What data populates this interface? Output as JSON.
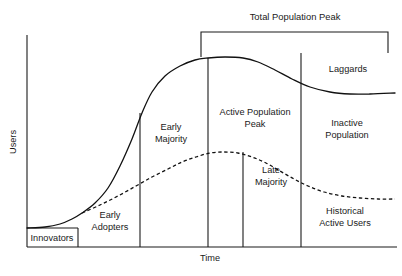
{
  "figure": {
    "type": "line",
    "background_color": "#ffffff",
    "ink_color": "#1a1a1a"
  },
  "axes": {
    "y_label": "Users",
    "x_label": "Time",
    "x_range_px": [
      27,
      395
    ],
    "y_range_px": [
      35,
      247
    ],
    "grid": false,
    "ticks": false
  },
  "bracket": {
    "label": "Total Population Peak",
    "start_px": 201,
    "end_px": 388
  },
  "segments": [
    {
      "key": "innovators",
      "label": "Innovators",
      "boundary_px": 78
    },
    {
      "key": "early-adopters",
      "label": "Early\nAdopters",
      "boundary_px": 140
    },
    {
      "key": "early-majority",
      "label": "Early\nMajority",
      "boundary_px": 208
    },
    {
      "key": "active-population-peak",
      "label": "Active Population\nPeak",
      "boundary_px": 243
    },
    {
      "key": "late-majority",
      "label": "Late\nMajority",
      "boundary_px": 301
    },
    {
      "key": "inactive-population",
      "label": "Inactive\nPopulation",
      "boundary_px": 395
    }
  ],
  "labels": {
    "innovators": "Innovators",
    "early_adopters_line1": "Early",
    "early_adopters_line2": "Adopters",
    "early_majority_line1": "Early",
    "early_majority_line2": "Majority",
    "active_peak_line1": "Active Population",
    "active_peak_line2": "Peak",
    "late_majority_line1": "Late",
    "late_majority_line2": "Majority",
    "inactive_population_line1": "Inactive",
    "inactive_population_line2": "Population",
    "laggards": "Laggards",
    "historical_line1": "Historical",
    "historical_line2": "Active Users"
  },
  "chart_data": {
    "type": "line",
    "title": "",
    "xlabel": "Time",
    "ylabel": "Users",
    "grid": false,
    "legend": "inline-annotations",
    "xlim": [
      27,
      395
    ],
    "ylim": [
      247,
      35
    ],
    "series": [
      {
        "name": "Total Population",
        "style": "solid",
        "color": "#111111",
        "points": [
          [
            27,
            228
          ],
          [
            45,
            227
          ],
          [
            60,
            224
          ],
          [
            72,
            219
          ],
          [
            82,
            213
          ],
          [
            95,
            203
          ],
          [
            108,
            188
          ],
          [
            120,
            166
          ],
          [
            132,
            139
          ],
          [
            142,
            113
          ],
          [
            152,
            92
          ],
          [
            165,
            76
          ],
          [
            180,
            66
          ],
          [
            195,
            60
          ],
          [
            208,
            58
          ],
          [
            225,
            57
          ],
          [
            243,
            58
          ],
          [
            258,
            62
          ],
          [
            275,
            70
          ],
          [
            292,
            79
          ],
          [
            310,
            87
          ],
          [
            330,
            92
          ],
          [
            350,
            94
          ],
          [
            370,
            94
          ],
          [
            395,
            93
          ]
        ]
      },
      {
        "name": "Historical Active Users",
        "style": "dashed",
        "color": "#111111",
        "points": [
          [
            82,
            213
          ],
          [
            100,
            205
          ],
          [
            118,
            196
          ],
          [
            136,
            186
          ],
          [
            152,
            177
          ],
          [
            168,
            169
          ],
          [
            182,
            162
          ],
          [
            196,
            157
          ],
          [
            210,
            153
          ],
          [
            224,
            152
          ],
          [
            238,
            153
          ],
          [
            252,
            157
          ],
          [
            266,
            163
          ],
          [
            280,
            171
          ],
          [
            294,
            179
          ],
          [
            308,
            186
          ],
          [
            324,
            192
          ],
          [
            342,
            196
          ],
          [
            360,
            198
          ],
          [
            378,
            199
          ],
          [
            395,
            199
          ]
        ]
      }
    ],
    "annotations": [
      {
        "text": "Total Population Peak",
        "x": 295,
        "y": 18,
        "role": "bracket-title"
      },
      {
        "text": "Innovators",
        "x": 52,
        "y": 239,
        "role": "segment"
      },
      {
        "text": "Early Adopters",
        "x": 110,
        "y": 222,
        "role": "segment"
      },
      {
        "text": "Early Majority",
        "x": 171,
        "y": 134,
        "role": "segment"
      },
      {
        "text": "Active Population Peak",
        "x": 255,
        "y": 119,
        "role": "segment"
      },
      {
        "text": "Late Majority",
        "x": 271,
        "y": 177,
        "role": "segment"
      },
      {
        "text": "Inactive Population",
        "x": 347,
        "y": 130,
        "role": "segment"
      },
      {
        "text": "Laggards",
        "x": 348,
        "y": 70,
        "role": "segment"
      },
      {
        "text": "Historical Active Users",
        "x": 345,
        "y": 218,
        "role": "series-label"
      }
    ]
  }
}
